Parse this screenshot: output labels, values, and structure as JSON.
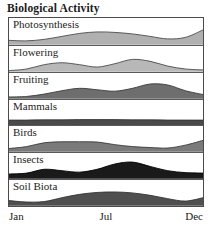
{
  "chart_title": "Biological Activity",
  "axis": {
    "ticks": [
      {
        "label": "Jan",
        "position": "left"
      },
      {
        "label": "Jul",
        "position": "center"
      },
      {
        "label": "Dec",
        "position": "right"
      }
    ]
  },
  "chart_data": {
    "type": "area",
    "title": "Biological Activity",
    "xlabel": "",
    "ylabel": "",
    "x": [
      "Jan",
      "Feb",
      "Mar",
      "Apr",
      "May",
      "Jun",
      "Jul",
      "Aug",
      "Sep",
      "Oct",
      "Nov",
      "Dec"
    ],
    "xlim": [
      0,
      11
    ],
    "ylim": [
      0,
      1
    ],
    "grid": false,
    "legend": "none",
    "layout": "stacked-bands-small-multiples",
    "band_count": 7,
    "series": [
      {
        "name": "Photosynthesis",
        "fill_color": "#b0b0b0",
        "line_color": "#4a4a4a",
        "values": [
          0.18,
          0.16,
          0.22,
          0.34,
          0.46,
          0.52,
          0.5,
          0.44,
          0.34,
          0.24,
          0.3,
          0.6
        ]
      },
      {
        "name": "Flowering",
        "fill_color": "#b8b8b8",
        "line_color": "#4a4a4a",
        "values": [
          0.05,
          0.12,
          0.3,
          0.38,
          0.3,
          0.2,
          0.34,
          0.52,
          0.44,
          0.24,
          0.12,
          0.08
        ]
      },
      {
        "name": "Fruiting",
        "fill_color": "#6e6e6e",
        "line_color": "#3a3a3a",
        "values": [
          0.08,
          0.1,
          0.2,
          0.34,
          0.44,
          0.38,
          0.32,
          0.44,
          0.62,
          0.58,
          0.34,
          0.18
        ]
      },
      {
        "name": "Mammals",
        "fill_color": "#4a4a4a",
        "line_color": "#333333",
        "values": [
          0.24,
          0.24,
          0.25,
          0.25,
          0.26,
          0.26,
          0.26,
          0.25,
          0.25,
          0.24,
          0.24,
          0.24
        ]
      },
      {
        "name": "Birds",
        "fill_color": "#7a7a7a",
        "line_color": "#3a3a3a",
        "values": [
          0.14,
          0.22,
          0.38,
          0.42,
          0.42,
          0.41,
          0.3,
          0.22,
          0.18,
          0.16,
          0.28,
          0.48
        ]
      },
      {
        "name": "Insects",
        "fill_color": "#1a1a1a",
        "line_color": "#000000",
        "values": [
          0.2,
          0.24,
          0.4,
          0.34,
          0.28,
          0.4,
          0.62,
          0.7,
          0.52,
          0.34,
          0.26,
          0.24
        ]
      },
      {
        "name": "Soil Biota",
        "fill_color": "#4f4f4f",
        "line_color": "#333333",
        "values": [
          0.22,
          0.16,
          0.18,
          0.34,
          0.48,
          0.56,
          0.58,
          0.54,
          0.44,
          0.3,
          0.2,
          0.34
        ]
      }
    ]
  }
}
